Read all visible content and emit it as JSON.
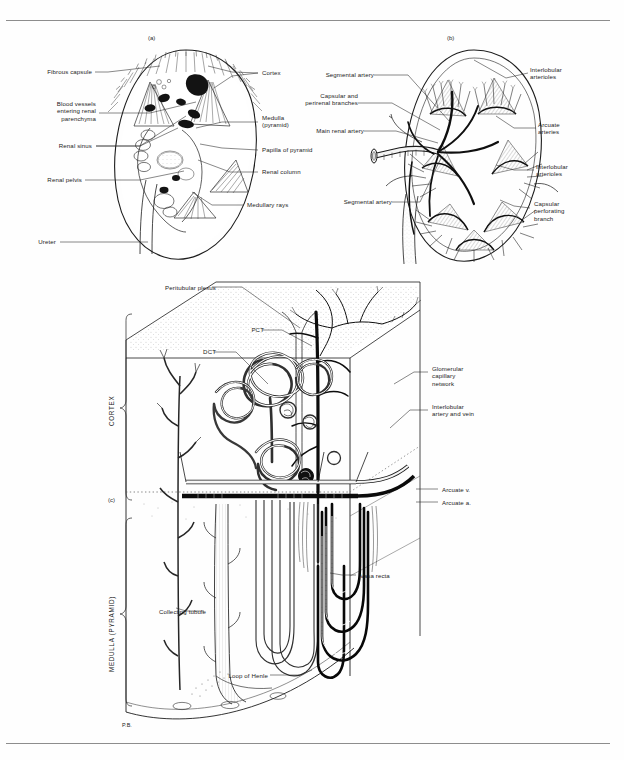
{
  "figure": {
    "panels": [
      {
        "id": "panel_a",
        "tag": "(a)",
        "caption": "Coronal section of the kidney"
      },
      {
        "id": "panel_b",
        "tag": "(b)",
        "caption": "Arterial supply of the kidney"
      },
      {
        "id": "panel_c",
        "tag": "(c)",
        "caption": "Nephron and its blood supply through cortex and medulla"
      }
    ]
  },
  "panel_a": {
    "tag": "(a)",
    "labels_left": [
      {
        "text": "Fibrous capsule"
      },
      {
        "text": "Blood vessels\nentering renal\nparenchyma"
      },
      {
        "text": "Renal sinus"
      },
      {
        "text": "Renal pelvis"
      },
      {
        "text": "Ureter"
      }
    ],
    "labels_right": [
      {
        "text": "Cortex"
      },
      {
        "text": "Medulla\n(pyramid)"
      },
      {
        "text": "Papilla of pyramid"
      },
      {
        "text": "Renal column"
      },
      {
        "text": "Medullary rays"
      }
    ]
  },
  "panel_b": {
    "tag": "(b)",
    "labels_left": [
      {
        "text": "Segmental artery"
      },
      {
        "text": "Capsular and\nperirenal branches"
      },
      {
        "text": "Main renal artery"
      },
      {
        "text": "Segmental artery"
      }
    ],
    "labels_right": [
      {
        "text": "Interlobular\narterioles"
      },
      {
        "text": "Arcuate\narteries"
      },
      {
        "text": "Interlobular\narterioles"
      },
      {
        "text": "Capsular\nperforating\nbranch"
      }
    ]
  },
  "panel_c": {
    "tag": "(c)",
    "zones": [
      {
        "text": "CORTEX"
      },
      {
        "text": "MEDULLA (PYRAMID)"
      }
    ],
    "labels": [
      {
        "text": "Peritubular plexus"
      },
      {
        "text": "PCT"
      },
      {
        "text": "DCT"
      },
      {
        "text": "Glomerular\ncapillary\nnetwork"
      },
      {
        "text": "Interlobular\nartery and vein"
      },
      {
        "text": "Arcuate v."
      },
      {
        "text": "Arcuate a."
      },
      {
        "text": "Vasa recta"
      },
      {
        "text": "Collecting tubule"
      },
      {
        "text": "Loop of Henle"
      },
      {
        "text": "P.B."
      }
    ]
  },
  "colors": {
    "ink": "#1c1c1c",
    "rule": "#8d8d8d",
    "page": "#fefefe",
    "stipple": "#6e6e6e"
  }
}
